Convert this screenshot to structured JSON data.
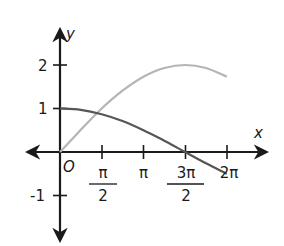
{
  "chart_data": {
    "type": "line",
    "title": "",
    "xlabel": "x",
    "ylabel": "y",
    "origin_label": "O",
    "xlim": [
      -1.3,
      7.0
    ],
    "ylim": [
      -2.1,
      2.85
    ],
    "x_ticks": [
      {
        "value": 1.5708,
        "label_num": "π",
        "label_den": "2"
      },
      {
        "value": 3.1416,
        "label_num": "π",
        "label_den": ""
      },
      {
        "value": 4.7124,
        "label_num": "3π",
        "label_den": "2"
      },
      {
        "value": 6.2832,
        "label_num": "2π",
        "label_den": ""
      }
    ],
    "y_ticks": [
      {
        "value": 2,
        "label": "2"
      },
      {
        "value": 1,
        "label": "1"
      },
      {
        "value": -1,
        "label": "-1"
      }
    ],
    "grid": false,
    "legend": null,
    "series": [
      {
        "name": "y = 2 sin(x/3)",
        "color": "#b5b5b5",
        "x": [
          0,
          0.785,
          1.571,
          2.356,
          3.142,
          3.927,
          4.712,
          5.498,
          6.283
        ],
        "y": [
          0,
          0.51,
          1.0,
          1.41,
          1.73,
          1.93,
          2.0,
          1.93,
          1.73
        ]
      },
      {
        "name": "y = cos(x/3)",
        "color": "#555555",
        "x": [
          0,
          0.785,
          1.571,
          2.356,
          3.142,
          3.927,
          4.712,
          5.498,
          6.283
        ],
        "y": [
          1.0,
          0.97,
          0.87,
          0.71,
          0.5,
          0.26,
          0.0,
          -0.26,
          -0.5
        ]
      }
    ]
  }
}
